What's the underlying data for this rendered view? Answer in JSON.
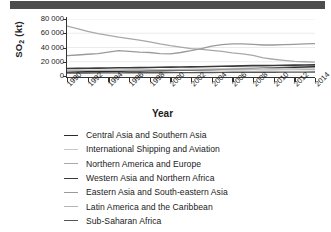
{
  "window": {
    "header_bar_color": "#4d4d4d"
  },
  "chart_data": {
    "type": "line",
    "title": "",
    "xlabel": "Year",
    "ylabel": "SO2 (kt)",
    "ylabel_base": "SO",
    "ylabel_sub": "2",
    "ylabel_unit": " (kt)",
    "grid": true,
    "legend_position": "bottom",
    "xlim": [
      1990,
      2014
    ],
    "ylim": [
      0,
      80000
    ],
    "x": [
      1990,
      1991,
      1992,
      1993,
      1994,
      1995,
      1996,
      1997,
      1998,
      1999,
      2000,
      2001,
      2002,
      2003,
      2004,
      2005,
      2006,
      2007,
      2008,
      2009,
      2010,
      2011,
      2012,
      2013,
      2014
    ],
    "xticks": [
      1990,
      1992,
      1994,
      1996,
      1998,
      2000,
      2002,
      2004,
      2006,
      2008,
      2010,
      2012,
      2014
    ],
    "xtick_labels": [
      "1990",
      "1992",
      "1994",
      "1996",
      "1998",
      "2000",
      "2002",
      "2004",
      "2006",
      "2008",
      "2010",
      "2012",
      "2014"
    ],
    "yticks": [
      0,
      20000,
      40000,
      60000,
      80000
    ],
    "ytick_labels": [
      "0",
      "20 000",
      "40 000",
      "60 000",
      "80 000"
    ],
    "series": [
      {
        "name": "Central Asia and Southern Asia",
        "color": "#2b2b2b",
        "width": 1.5,
        "values": [
          5200,
          5500,
          5800,
          6000,
          6300,
          6600,
          6900,
          7100,
          7300,
          7500,
          7800,
          8000,
          8200,
          8500,
          8900,
          9400,
          9900,
          10300,
          10700,
          11000,
          11400,
          11800,
          12200,
          12600,
          13000
        ]
      },
      {
        "name": "International Shipping and Aviation",
        "color": "#c8c8c8",
        "width": 1.1,
        "values": [
          7800,
          7900,
          8000,
          8100,
          8200,
          8400,
          8600,
          8800,
          9000,
          9200,
          9400,
          9500,
          9700,
          9900,
          10200,
          10500,
          10800,
          11000,
          11100,
          10600,
          10800,
          10900,
          10500,
          10200,
          10000
        ]
      },
      {
        "name": "Northern America and Europe",
        "color": "#a8a8a8",
        "width": 1.3,
        "values": [
          70000,
          66500,
          62500,
          59500,
          57000,
          54500,
          52500,
          50500,
          48000,
          45000,
          42500,
          40500,
          38500,
          37500,
          36000,
          34500,
          32500,
          31000,
          29000,
          25500,
          23500,
          22000,
          20500,
          20000,
          19500
        ]
      },
      {
        "name": "Western Asia and Northern Africa",
        "color": "#3a3a3a",
        "width": 1.6,
        "values": [
          10500,
          10700,
          10900,
          11100,
          11300,
          11500,
          11600,
          11800,
          12000,
          12200,
          12400,
          12600,
          12800,
          13000,
          13300,
          13600,
          13900,
          14200,
          14500,
          14600,
          14800,
          15000,
          15200,
          15400,
          15600
        ]
      },
      {
        "name": "Eastern Asia and South-eastern Asia",
        "color": "#9a9a9a",
        "width": 1.3,
        "values": [
          28500,
          29500,
          30500,
          31500,
          33500,
          35500,
          34500,
          33500,
          33000,
          31500,
          31000,
          33000,
          35500,
          38500,
          42000,
          44000,
          45000,
          45000,
          44500,
          43500,
          43500,
          44000,
          44500,
          45000,
          45500
        ]
      },
      {
        "name": "Latin America and the Caribbean",
        "color": "#b5b5b5",
        "width": 1.2,
        "values": [
          7600,
          7700,
          7800,
          7900,
          8000,
          8100,
          8200,
          8300,
          8400,
          8400,
          8500,
          8500,
          8400,
          8400,
          8500,
          8600,
          8700,
          8700,
          8800,
          8600,
          8700,
          8800,
          8800,
          8900,
          8900
        ]
      },
      {
        "name": "Sub-Saharan Africa",
        "color": "#555555",
        "width": 1.4,
        "values": [
          4200,
          4250,
          4300,
          4350,
          4400,
          4450,
          4500,
          4550,
          4600,
          4650,
          4700,
          4750,
          4800,
          4900,
          5000,
          5100,
          5200,
          5250,
          5300,
          5300,
          5350,
          5400,
          5450,
          5500,
          5550
        ]
      }
    ]
  }
}
